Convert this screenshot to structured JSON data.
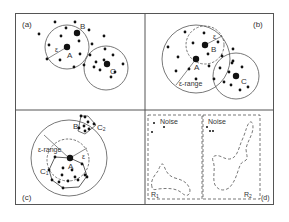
{
  "figure": {
    "panels": [
      {
        "id": "a",
        "label": "(a)",
        "points": [
          "A",
          "B",
          "C"
        ],
        "epsilon_label": "ε"
      },
      {
        "id": "b",
        "label": "(b)",
        "points": [
          "A",
          "B",
          "C"
        ],
        "epsilon_label": "ε",
        "range_label": "ε-range"
      },
      {
        "id": "c",
        "label": "(c)",
        "points": [
          "A",
          "B"
        ],
        "clusters": [
          "C₁",
          "C₂"
        ],
        "epsilon_label": "ε",
        "range_label": "ε-range"
      },
      {
        "id": "d",
        "label": "(d)",
        "noise_labels": [
          "Noise",
          "Noise"
        ],
        "regions": [
          "R₁",
          "R₂"
        ]
      }
    ]
  },
  "labels": {
    "a": {
      "panel": "(a)",
      "A": "A",
      "B": "B",
      "C": "C",
      "eps": "ε"
    },
    "b": {
      "panel": "(b)",
      "A": "A",
      "B": "B",
      "C": "C",
      "eps": "ε",
      "range": "ε-range"
    },
    "c": {
      "panel": "(c)",
      "A": "A",
      "B": "B",
      "C1": "C",
      "C1sub": "1",
      "C2": "C",
      "C2sub": "2",
      "eps": "ε",
      "range": "ε-range"
    },
    "d": {
      "panel": "(d)",
      "noise1": "Noise",
      "noise2": "Noise",
      "R1": "R",
      "R1sub": "1",
      "R2": "R",
      "R2sub": "2"
    }
  },
  "colors": {
    "ink": "#222222",
    "frame": "#555555",
    "background": "#ffffff"
  }
}
